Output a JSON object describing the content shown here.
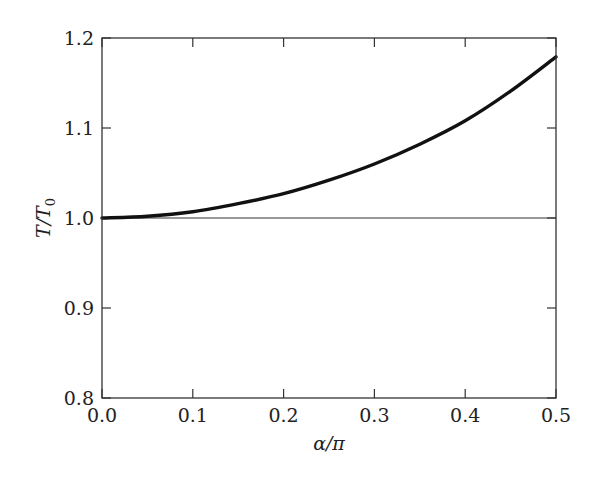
{
  "chart_data": {
    "type": "line",
    "title": "",
    "xlabel": "α/π",
    "ylabel": "T/T0",
    "ylabel_main": "T/T",
    "ylabel_sub": "0",
    "xlim": [
      0.0,
      0.5
    ],
    "ylim": [
      0.8,
      1.2
    ],
    "xticks": [
      0.0,
      0.1,
      0.2,
      0.3,
      0.4,
      0.5
    ],
    "xtick_labels": [
      "0.0",
      "0.1",
      "0.2",
      "0.3",
      "0.4",
      "0.5"
    ],
    "yticks": [
      0.8,
      0.9,
      1.0,
      1.1,
      1.2
    ],
    "ytick_labels": [
      "0.8",
      "0.9",
      "1.0",
      "1.1",
      "1.2"
    ],
    "grid": false,
    "legend": null,
    "reference_line": {
      "y": 1.0,
      "style": "thin"
    },
    "series": [
      {
        "name": "T/T0",
        "style": "thick",
        "x": [
          0.0,
          0.05,
          0.1,
          0.15,
          0.2,
          0.25,
          0.3,
          0.35,
          0.4,
          0.45,
          0.5
        ],
        "y": [
          1.0,
          1.002,
          1.007,
          1.016,
          1.027,
          1.042,
          1.06,
          1.082,
          1.108,
          1.141,
          1.179
        ]
      }
    ]
  }
}
